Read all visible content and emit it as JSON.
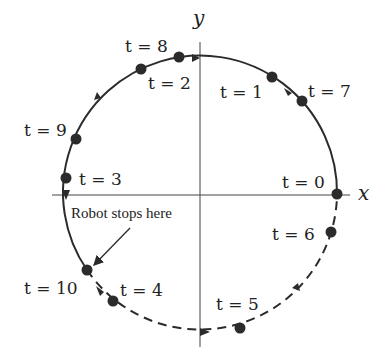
{
  "diagram": {
    "title": "",
    "axes": {
      "x_label": "x",
      "y_label": "y"
    },
    "annotation": "Robot stops here",
    "colors": {
      "stroke": "#2b2b2b",
      "point": "#2b2b2b",
      "background": "#ffffff"
    },
    "path": {
      "description": "Robot moves around unit circle; solid arc from t=0 counterclockwise to t=10, dashed arc from t=10 back to t=0",
      "solid_segment": "t=0 to t=10 (counterclockwise through top)",
      "dashed_segment": "t=10 to t=0 (lower right quadrant)"
    },
    "points": [
      {
        "t": 0,
        "label": "t = 0"
      },
      {
        "t": 1,
        "label": "t = 1"
      },
      {
        "t": 2,
        "label": "t = 2"
      },
      {
        "t": 3,
        "label": "t = 3"
      },
      {
        "t": 4,
        "label": "t = 4"
      },
      {
        "t": 5,
        "label": "t = 5"
      },
      {
        "t": 6,
        "label": "t = 6"
      },
      {
        "t": 7,
        "label": "t = 7"
      },
      {
        "t": 8,
        "label": "t = 8"
      },
      {
        "t": 9,
        "label": "t = 9"
      },
      {
        "t": 10,
        "label": "t = 10"
      }
    ]
  }
}
